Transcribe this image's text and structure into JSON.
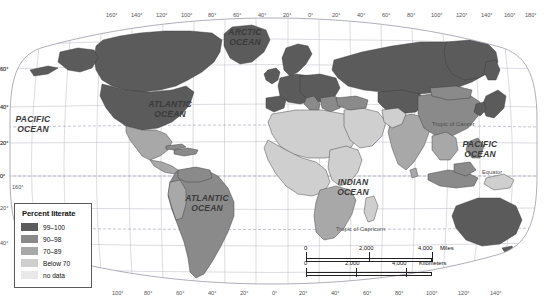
{
  "map": {
    "title": "World literacy rates",
    "projection": "Robinson",
    "background": "#ffffff",
    "graticule_color": "#b9b9c4",
    "country_border_color": "#3c3c3c",
    "coast_color": "#2b2b2b"
  },
  "legend": {
    "title": "Percent literate",
    "items": [
      {
        "label": "99–100",
        "color": "#5b5b5b"
      },
      {
        "label": "90–98",
        "color": "#8a8a8a"
      },
      {
        "label": "70–89",
        "color": "#a8a8a8"
      },
      {
        "label": "Below 70",
        "color": "#cfcfcf"
      },
      {
        "label": "no data",
        "color": "#e9e9e9"
      }
    ]
  },
  "ocean_labels": [
    {
      "name": "arctic-ocean",
      "text": "ARCTIC\nOCEAN",
      "x": 245,
      "y": 34
    },
    {
      "name": "pacific-ocean-west",
      "text": "PACIFIC\nOCEAN",
      "x": 32,
      "y": 122
    },
    {
      "name": "atlantic-ocean-north",
      "text": "ATLANTIC\nOCEAN",
      "x": 168,
      "y": 106
    },
    {
      "name": "atlantic-ocean-south",
      "text": "ATLANTIC\nOCEAN",
      "x": 205,
      "y": 200
    },
    {
      "name": "indian-ocean",
      "text": "INDIAN\nOCEAN",
      "x": 352,
      "y": 185
    },
    {
      "name": "pacific-ocean-east",
      "text": "PACIFIC\nOCEAN",
      "x": 479,
      "y": 147
    }
  ],
  "reference_lines": [
    {
      "name": "tropic-of-cancer",
      "text": "Tropic of Cancer",
      "x": 468,
      "y": 124
    },
    {
      "name": "equator",
      "text": "Equator",
      "x": 494,
      "y": 172
    },
    {
      "name": "tropic-of-capricorn",
      "text": "Tropic of Capricorn",
      "x": 372,
      "y": 230
    }
  ],
  "longitude_labels_top": [
    {
      "text": "160°",
      "x": 112
    },
    {
      "text": "140°",
      "x": 137
    },
    {
      "text": "120°",
      "x": 162
    },
    {
      "text": "100°",
      "x": 187
    },
    {
      "text": "80°",
      "x": 214
    },
    {
      "text": "60°",
      "x": 239
    },
    {
      "text": "40°",
      "x": 264
    },
    {
      "text": "20°",
      "x": 289
    },
    {
      "text": "0°",
      "x": 314
    },
    {
      "text": "20°",
      "x": 338
    },
    {
      "text": "40°",
      "x": 363
    },
    {
      "text": "60°",
      "x": 388
    },
    {
      "text": "80°",
      "x": 413
    },
    {
      "text": "100°",
      "x": 437
    },
    {
      "text": "120°",
      "x": 462
    },
    {
      "text": "140°",
      "x": 487
    },
    {
      "text": "160°",
      "x": 510
    },
    {
      "text": "180°",
      "x": 531
    }
  ],
  "longitude_labels_bottom": [
    {
      "text": "100°",
      "x": 118
    },
    {
      "text": "80°",
      "x": 150
    },
    {
      "text": "60°",
      "x": 182
    },
    {
      "text": "40°",
      "x": 214
    },
    {
      "text": "20°",
      "x": 246
    },
    {
      "text": "0°",
      "x": 278
    },
    {
      "text": "20°",
      "x": 305
    },
    {
      "text": "40°",
      "x": 337
    },
    {
      "text": "60°",
      "x": 369
    },
    {
      "text": "80°",
      "x": 401
    },
    {
      "text": "100°",
      "x": 432
    },
    {
      "text": "120°",
      "x": 464
    },
    {
      "text": "140°",
      "x": 496
    }
  ],
  "latitude_labels_left": [
    {
      "text": "60°",
      "y": 69
    },
    {
      "text": "40°",
      "y": 107
    },
    {
      "text": "20°",
      "y": 143
    },
    {
      "text": "0°",
      "y": 176
    }
  ],
  "latitude_labels_left_extra": [
    {
      "text": "160°",
      "x": 12,
      "y": 184
    }
  ],
  "latitude_labels_right": [
    {
      "text": "60°",
      "y": 69
    },
    {
      "text": "40°",
      "y": 107
    },
    {
      "text": "20°",
      "y": 143
    },
    {
      "text": "0°",
      "y": 176
    },
    {
      "text": "20°",
      "y": 208
    },
    {
      "text": "40°",
      "y": 243
    }
  ],
  "scale_bar": {
    "miles": {
      "unit": "Miles",
      "ticks": [
        "0",
        "2,000",
        "4,000"
      ]
    },
    "kilometers": {
      "unit": "Kilometers",
      "ticks": [
        "0",
        "2,000",
        "4,000"
      ]
    }
  },
  "chart_data": {
    "type": "map",
    "title": "Percent literate",
    "classes": [
      "99–100",
      "90–98",
      "70–89",
      "Below 70",
      "no data"
    ],
    "class_colors": [
      "#5b5b5b",
      "#8a8a8a",
      "#a8a8a8",
      "#cfcfcf",
      "#e9e9e9"
    ],
    "regions": [
      {
        "name": "North America (USA, Canada)",
        "class": "99–100"
      },
      {
        "name": "Greenland",
        "class": "99–100"
      },
      {
        "name": "Europe (western & northern)",
        "class": "99–100"
      },
      {
        "name": "Russia",
        "class": "99–100"
      },
      {
        "name": "Japan / Korea",
        "class": "99–100"
      },
      {
        "name": "Australia / New Zealand",
        "class": "99–100"
      },
      {
        "name": "Mexico",
        "class": "90–98"
      },
      {
        "name": "Brazil & most of South America",
        "class": "90–98"
      },
      {
        "name": "China / Mongolia",
        "class": "90–98"
      },
      {
        "name": "Southern Africa",
        "class": "70–89"
      },
      {
        "name": "Peru / Bolivia",
        "class": "70–89"
      },
      {
        "name": "India / South Asia",
        "class": "70–89"
      },
      {
        "name": "Sub-Saharan & North Africa",
        "class": "Below 70"
      },
      {
        "name": "Afghanistan / Pakistan",
        "class": "Below 70"
      }
    ]
  }
}
